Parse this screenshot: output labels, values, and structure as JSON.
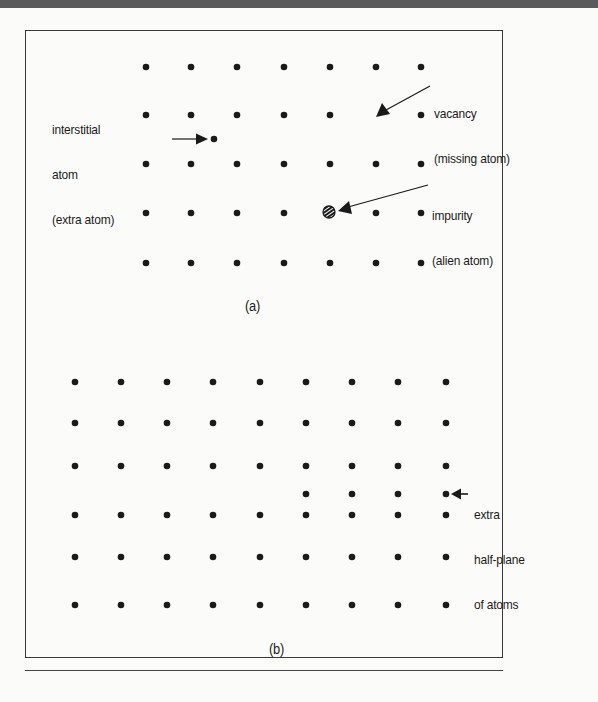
{
  "figure": {
    "colors": {
      "atom": "#1a1a1a",
      "frame": "#3a3a3a",
      "top_band": "#5a5a5a",
      "background": "#fbfbfa"
    },
    "panel_a": {
      "label": "(a)",
      "lattice": {
        "columns_x": [
          146,
          191,
          237,
          284,
          330,
          376,
          421
        ],
        "rows_y": [
          67,
          115,
          164,
          213,
          263
        ],
        "missing_sites": [
          [
            376,
            115
          ],
          [
            330,
            213
          ]
        ]
      },
      "defects": {
        "interstitial": {
          "line1": "interstitial",
          "line2": "atom",
          "line3": "(extra atom)",
          "position": [
            214,
            139
          ]
        },
        "vacancy": {
          "line1": "vacancy",
          "line2": "(missing atom)",
          "position": [
            376,
            115
          ]
        },
        "impurity": {
          "line1": "impurity",
          "line2": "(alien atom)",
          "position": [
            329,
            212
          ]
        }
      }
    },
    "panel_b": {
      "label": "(b)",
      "lattice": {
        "columns_x": [
          75,
          121,
          167,
          213,
          260,
          306,
          352,
          398,
          446
        ],
        "full_rows_y": [
          382,
          423,
          466,
          515,
          557,
          605
        ],
        "partial_row": {
          "y": 494,
          "columns_x": [
            306,
            352,
            398,
            446
          ]
        }
      },
      "annotation": {
        "line1": "extra",
        "line2": "half-plane",
        "line3": "of atoms"
      }
    }
  }
}
